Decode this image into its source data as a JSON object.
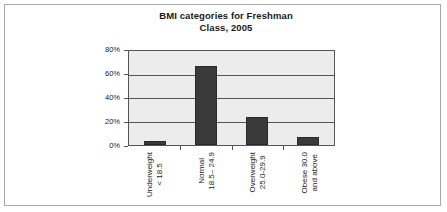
{
  "chart_data": {
    "type": "bar",
    "title": "BMI categories for Freshman Class, 2005",
    "title_line1": "BMI categories for Freshman",
    "title_line2": "Class, 2005",
    "xlabel": "",
    "ylabel": "",
    "categories": [
      "Underweight < 18.5",
      "Normal 18.5– 24.9",
      "Overweight 25.0-29.9",
      "Obese 30.0 and above"
    ],
    "category_lines": [
      {
        "line1": "Underweight",
        "line2": "< 18.5"
      },
      {
        "line1": "Normal",
        "line2": "18.5– 24.9"
      },
      {
        "line1": "Overweight",
        "line2": "25.0-29.9"
      },
      {
        "line1": "Obese 30.0",
        "line2": "and above"
      }
    ],
    "values": [
      3,
      67,
      24,
      7
    ],
    "ylim": [
      0,
      80
    ],
    "ytick_labels": [
      "0%",
      "20%",
      "40%",
      "60%",
      "80%"
    ],
    "ytick_values": [
      0,
      20,
      40,
      60,
      80
    ],
    "grid": true,
    "legend": false,
    "bar_color": "#3a3a3a",
    "plot_background": "#ececec",
    "axis_color": "#555555",
    "frame_color": "#a9a9a9"
  }
}
